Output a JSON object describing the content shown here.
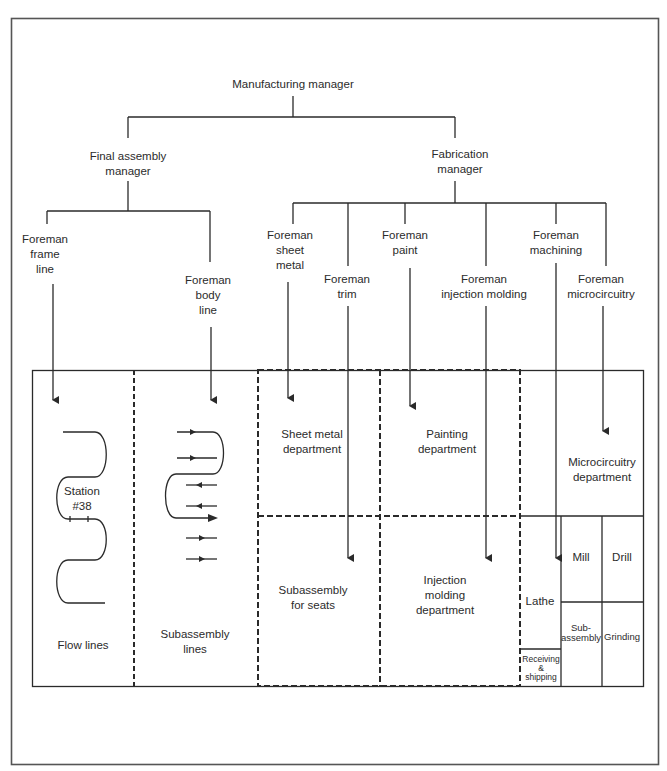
{
  "diagram": {
    "type": "organization-chart-with-plant-layout",
    "colors": {
      "line": "#2a2a2a",
      "background": "#ffffff"
    },
    "org_chart": {
      "top": {
        "lines": [
          "Manufacturing manager"
        ]
      },
      "managers": [
        {
          "id": "final_assembly",
          "lines": [
            "Final assembly",
            "manager"
          ]
        },
        {
          "id": "fabrication",
          "lines": [
            "Fabrication",
            "manager"
          ]
        }
      ],
      "foremen": [
        {
          "id": "frame_line",
          "reports_to": "final_assembly",
          "lines": [
            "Foreman",
            "frame",
            "line"
          ],
          "assigned_to": "flow_lines"
        },
        {
          "id": "body_line",
          "reports_to": "final_assembly",
          "lines": [
            "Foreman",
            "body",
            "line"
          ],
          "assigned_to": "subassembly_lines"
        },
        {
          "id": "sheet_metal",
          "reports_to": "fabrication",
          "lines": [
            "Foreman",
            "sheet",
            "metal"
          ],
          "assigned_to": "sheet_metal_department"
        },
        {
          "id": "trim",
          "reports_to": "fabrication",
          "lines": [
            "Foreman",
            "trim"
          ],
          "assigned_to": "subassembly_for_seats"
        },
        {
          "id": "paint",
          "reports_to": "fabrication",
          "lines": [
            "Foreman",
            "paint"
          ],
          "assigned_to": "painting_department"
        },
        {
          "id": "injection_molding",
          "reports_to": "fabrication",
          "lines": [
            "Foreman",
            "injection molding"
          ],
          "assigned_to": "injection_molding_department"
        },
        {
          "id": "machining",
          "reports_to": "fabrication",
          "lines": [
            "Foreman",
            "machining"
          ],
          "assigned_to": "lathe"
        },
        {
          "id": "microcircuitry",
          "reports_to": "fabrication",
          "lines": [
            "Foreman",
            "microcircuitry"
          ],
          "assigned_to": "microcircuitry_department"
        }
      ]
    },
    "plant_layout": {
      "areas": [
        {
          "id": "flow_lines",
          "lines": [
            "Flow lines"
          ],
          "station_label": [
            "Station",
            "#38"
          ]
        },
        {
          "id": "subassembly_lines",
          "lines": [
            "Subassembly",
            "lines"
          ]
        },
        {
          "id": "sheet_metal_department",
          "lines": [
            "Sheet metal",
            "department"
          ]
        },
        {
          "id": "painting_department",
          "lines": [
            "Painting",
            "department"
          ]
        },
        {
          "id": "subassembly_for_seats",
          "lines": [
            "Subassembly",
            "for seats"
          ]
        },
        {
          "id": "injection_molding_department",
          "lines": [
            "Injection",
            "molding",
            "department"
          ]
        },
        {
          "id": "microcircuitry_department",
          "lines": [
            "Microcircuitry",
            "department"
          ]
        },
        {
          "id": "lathe",
          "lines": [
            "Lathe"
          ]
        },
        {
          "id": "mill",
          "lines": [
            "Mill"
          ]
        },
        {
          "id": "drill",
          "lines": [
            "Drill"
          ]
        },
        {
          "id": "sub_assembly",
          "lines": [
            "Sub-",
            "assembly"
          ]
        },
        {
          "id": "grinding",
          "lines": [
            "Grinding"
          ]
        },
        {
          "id": "receiving_shipping",
          "lines": [
            "Receiving",
            "&",
            "shipping"
          ]
        }
      ]
    }
  }
}
